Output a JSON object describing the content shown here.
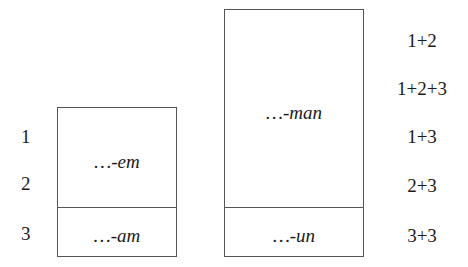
{
  "left_paradigm": {
    "box_upper_label": "…-em",
    "box_lower_label": "…-am",
    "row_labels": [
      "1",
      "2",
      "3"
    ]
  },
  "right_paradigm": {
    "box_upper_label": "…-man",
    "box_lower_label": "…-un",
    "row_labels": [
      "1+2",
      "1+2+3",
      "1+3",
      "2+3",
      "3+3"
    ]
  },
  "colors": {
    "border": "#555555",
    "text": "#1a1a1a",
    "background": "#ffffff"
  }
}
